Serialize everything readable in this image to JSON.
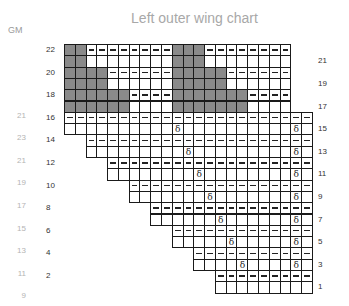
{
  "title": "Left outer wing chart",
  "gm_header": "GM",
  "colors": {
    "contrast": "#8a8a8a",
    "grid": "#1a1a1a",
    "label_dark": "#333333",
    "label_light": "#b4b4b4"
  },
  "symbols": {
    "purl": "–",
    "dec": "δ"
  },
  "left_row_labels": [
    "22",
    "20",
    "18",
    "16",
    "14",
    "12",
    "10",
    "8",
    "6",
    "4",
    "2"
  ],
  "right_row_labels": [
    "21",
    "19",
    "17",
    "15",
    "13",
    "11",
    "9",
    "7",
    "5",
    "3",
    "1"
  ],
  "gm_labels": [
    "21",
    "23",
    "21",
    "19",
    "17",
    "15",
    "13",
    "11",
    "9"
  ],
  "chart_data": {
    "type": "table",
    "title": "Left outer wing chart",
    "rows": 22,
    "columns": 23,
    "legend_notes": "gray = contrast colour; dash = purl; δ = decrease",
    "upper_section": {
      "rows_22_21": {
        "gray": [
          1,
          2,
          11,
          12,
          13
        ],
        "columns": 21
      },
      "rows_20_19": {
        "gray": [
          1,
          2,
          3,
          4,
          11,
          12,
          13,
          14,
          15
        ],
        "columns": 21
      },
      "rows_18_17": {
        "gray": [
          1,
          2,
          3,
          4,
          5,
          6,
          11,
          12,
          13,
          14,
          15,
          16,
          17
        ],
        "columns": 21
      },
      "even_rows_purl": true
    },
    "lower_section": [
      {
        "rows": "16/15",
        "start_col": 1,
        "dec_cols": [
          11,
          22
        ]
      },
      {
        "rows": "14/13",
        "start_col": 3,
        "dec_cols": [
          12,
          22
        ]
      },
      {
        "rows": "12/11",
        "start_col": 5,
        "dec_cols": [
          13,
          22
        ]
      },
      {
        "rows": "10/9",
        "start_col": 7,
        "dec_cols": [
          14,
          22
        ]
      },
      {
        "rows": "8/7",
        "start_col": 9,
        "dec_cols": [
          15,
          22
        ]
      },
      {
        "rows": "6/5",
        "start_col": 11,
        "dec_cols": [
          16,
          22
        ]
      },
      {
        "rows": "4/3",
        "start_col": 13,
        "dec_cols": [
          17,
          22
        ]
      },
      {
        "rows": "2/1",
        "start_col": 15,
        "dec_cols": []
      }
    ]
  }
}
